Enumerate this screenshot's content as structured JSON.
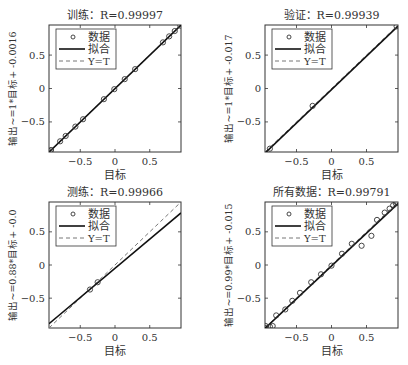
{
  "chart_data": [
    {
      "type": "scatter",
      "title": "训练：R=0.99997",
      "xlabel": "目标",
      "ylabel": "输出~=1*目标+ -0.0016",
      "xlim": [
        -0.95,
        0.95
      ],
      "ylim": [
        -0.95,
        0.95
      ],
      "xticks": [
        -0.5,
        0,
        0.5
      ],
      "yticks": [
        -0.5,
        0,
        0.5
      ],
      "grid": false,
      "legend": {
        "position": "upper-left",
        "entries": [
          "数据",
          "拟合",
          "Y=T"
        ]
      },
      "fit": {
        "slope": 1,
        "intercept": -0.0016
      },
      "points": [
        [
          -0.94,
          -0.94
        ],
        [
          -0.92,
          -0.92
        ],
        [
          -0.79,
          -0.79
        ],
        [
          -0.71,
          -0.71
        ],
        [
          -0.57,
          -0.57
        ],
        [
          -0.46,
          -0.46
        ],
        [
          -0.16,
          -0.16
        ],
        [
          -0.01,
          -0.01
        ],
        [
          0.14,
          0.14
        ],
        [
          0.29,
          0.29
        ],
        [
          0.69,
          0.69
        ],
        [
          0.78,
          0.78
        ],
        [
          0.86,
          0.86
        ],
        [
          0.94,
          0.94
        ]
      ]
    },
    {
      "type": "scatter",
      "title": "验证：R=0.99939",
      "xlabel": "目标",
      "ylabel": "输出~=1*目标+ -0.017",
      "xlim": [
        -0.95,
        0.95
      ],
      "ylim": [
        -0.95,
        0.95
      ],
      "xticks": [
        -0.5,
        0,
        0.5
      ],
      "yticks": [
        -0.5,
        0,
        0.5
      ],
      "grid": false,
      "legend": {
        "position": "upper-left",
        "entries": [
          "数据",
          "拟合",
          "Y=T"
        ]
      },
      "fit": {
        "slope": 1,
        "intercept": -0.017
      },
      "points": [
        [
          -0.88,
          -0.9
        ],
        [
          -0.27,
          -0.26
        ],
        [
          0.93,
          0.93
        ]
      ]
    },
    {
      "type": "scatter",
      "title": "测练：R=0.99966",
      "xlabel": "目标",
      "ylabel": "输出~=0.88*目标+ -0.0",
      "xlim": [
        -0.95,
        0.95
      ],
      "ylim": [
        -0.95,
        0.95
      ],
      "xticks": [
        -0.5,
        0,
        0.5
      ],
      "yticks": [
        -0.5,
        0,
        0.5
      ],
      "grid": false,
      "legend": {
        "position": "upper-left",
        "entries": [
          "数据",
          "拟合",
          "Y=T"
        ]
      },
      "fit": {
        "slope": 0.88,
        "intercept": -0.05
      },
      "points": [
        [
          -0.36,
          -0.37
        ],
        [
          -0.25,
          -0.26
        ]
      ]
    },
    {
      "type": "scatter",
      "title": "所有数据：R=0.99791",
      "xlabel": "目标",
      "ylabel": "输出~=0.99*目标+ -0.015",
      "xlim": [
        -0.95,
        0.95
      ],
      "ylim": [
        -0.95,
        0.95
      ],
      "xticks": [
        -0.5,
        0,
        0.5
      ],
      "yticks": [
        -0.5,
        0,
        0.5
      ],
      "grid": false,
      "legend": {
        "position": "upper-left",
        "entries": [
          "数据",
          "拟合",
          "Y=T"
        ]
      },
      "fit": {
        "slope": 0.99,
        "intercept": -0.015
      },
      "points": [
        [
          -0.94,
          -0.92
        ],
        [
          -0.93,
          -0.95
        ],
        [
          -0.88,
          -0.93
        ],
        [
          -0.84,
          -0.92
        ],
        [
          -0.79,
          -0.76
        ],
        [
          -0.66,
          -0.67
        ],
        [
          -0.56,
          -0.54
        ],
        [
          -0.45,
          -0.42
        ],
        [
          -0.29,
          -0.26
        ],
        [
          -0.15,
          -0.14
        ],
        [
          0.0,
          -0.01
        ],
        [
          0.15,
          0.17
        ],
        [
          0.29,
          0.32
        ],
        [
          0.43,
          0.29
        ],
        [
          0.57,
          0.44
        ],
        [
          0.65,
          0.68
        ],
        [
          0.76,
          0.79
        ],
        [
          0.83,
          0.85
        ],
        [
          0.88,
          0.9
        ],
        [
          0.92,
          0.93
        ],
        [
          0.94,
          0.95
        ]
      ]
    }
  ],
  "labels": {
    "data": "数据",
    "fit": "拟合",
    "yt": "Y=T",
    "tick_neg": "−0.5",
    "tick_zero": "0",
    "tick_pos": "0.5"
  }
}
